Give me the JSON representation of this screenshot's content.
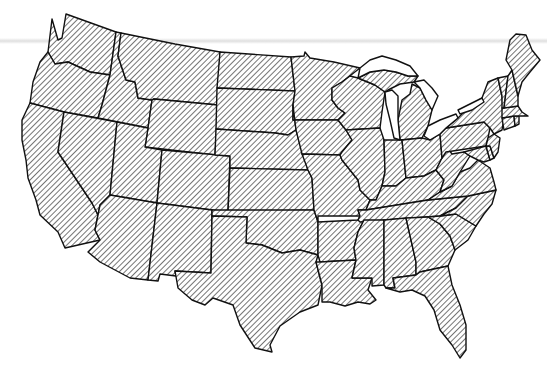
{
  "map": {
    "title": "Contiguous United States",
    "style": {
      "fill_pattern": "diagonal-hatch",
      "hatch_color": "#2a2a2a",
      "background": "#ffffff",
      "border_color": "#111111",
      "scan_band_color": "#d7d7d7"
    },
    "labels_visible": false,
    "regions": [
      {
        "name": "Washington"
      },
      {
        "name": "Oregon"
      },
      {
        "name": "California"
      },
      {
        "name": "Idaho"
      },
      {
        "name": "Nevada"
      },
      {
        "name": "Montana"
      },
      {
        "name": "Wyoming"
      },
      {
        "name": "Utah"
      },
      {
        "name": "Arizona"
      },
      {
        "name": "Colorado"
      },
      {
        "name": "New Mexico"
      },
      {
        "name": "North Dakota"
      },
      {
        "name": "South Dakota"
      },
      {
        "name": "Nebraska"
      },
      {
        "name": "Kansas"
      },
      {
        "name": "Oklahoma"
      },
      {
        "name": "Texas"
      },
      {
        "name": "Minnesota"
      },
      {
        "name": "Iowa"
      },
      {
        "name": "Missouri"
      },
      {
        "name": "Arkansas"
      },
      {
        "name": "Louisiana"
      },
      {
        "name": "Wisconsin"
      },
      {
        "name": "Illinois"
      },
      {
        "name": "Michigan"
      },
      {
        "name": "Indiana"
      },
      {
        "name": "Ohio"
      },
      {
        "name": "Kentucky"
      },
      {
        "name": "Tennessee"
      },
      {
        "name": "Mississippi"
      },
      {
        "name": "Alabama"
      },
      {
        "name": "Georgia"
      },
      {
        "name": "Florida"
      },
      {
        "name": "South Carolina"
      },
      {
        "name": "North Carolina"
      },
      {
        "name": "Virginia"
      },
      {
        "name": "West Virginia"
      },
      {
        "name": "Pennsylvania"
      },
      {
        "name": "New York"
      },
      {
        "name": "Maryland"
      },
      {
        "name": "Delaware"
      },
      {
        "name": "New Jersey"
      },
      {
        "name": "Connecticut"
      },
      {
        "name": "Rhode Island"
      },
      {
        "name": "Massachusetts"
      },
      {
        "name": "Vermont"
      },
      {
        "name": "New Hampshire"
      },
      {
        "name": "Maine"
      }
    ],
    "water_bodies": [
      {
        "name": "Lake Superior"
      },
      {
        "name": "Lake Michigan"
      },
      {
        "name": "Lake Huron"
      },
      {
        "name": "Lake Erie"
      },
      {
        "name": "Lake Ontario"
      }
    ]
  }
}
